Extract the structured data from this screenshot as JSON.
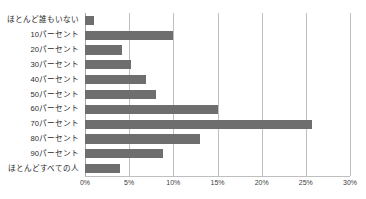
{
  "chart_data": {
    "type": "bar",
    "orientation": "horizontal",
    "title": "",
    "subtitle": "",
    "xlabel": "",
    "ylabel": "",
    "xlim": [
      0,
      30
    ],
    "ylim": null,
    "grid": true,
    "legend": false,
    "legend_position": "none",
    "bar_color": "#6e6e6e",
    "gridline_color": "#bfbfbf",
    "background_color": "#ffffff",
    "xtick_labels": [
      "0%",
      "5%",
      "10%",
      "15%",
      "20%",
      "25%",
      "30%"
    ],
    "xtick_values": [
      0,
      5,
      10,
      15,
      20,
      25,
      30
    ],
    "categories": [
      "ほとんど誰もいない",
      "10パーセント",
      "20パーセント",
      "30パーセント",
      "40パーセント",
      "50パーセント",
      "60パーセント",
      "70パーセント",
      "80パーセント",
      "90パーセント",
      "ほとんどすべての人"
    ],
    "values": [
      1,
      10,
      4.2,
      5.2,
      6.9,
      8,
      15,
      25.7,
      13,
      8.8,
      4
    ]
  }
}
